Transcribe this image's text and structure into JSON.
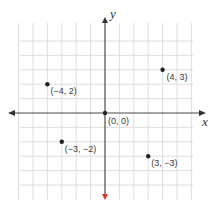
{
  "diagram": {
    "type": "coordinate-plane",
    "axes": {
      "x_label": "x",
      "y_label": "y"
    },
    "grid": {
      "x_range": [
        -6,
        6
      ],
      "y_range": [
        -5,
        5
      ],
      "spacing_px": 14.4,
      "origin_px": [
        105,
        113
      ],
      "line_color": "#d6d6d6",
      "axis_color": "#4a4a4a",
      "accent_arrow_color": "#d9342b"
    },
    "points": [
      {
        "x": 0,
        "y": 0,
        "label": "(0, 0)",
        "label_dx": 3,
        "label_dy": 11
      },
      {
        "x": 4,
        "y": 3,
        "label": "(4, 3)",
        "label_dx": 4,
        "label_dy": 10
      },
      {
        "x": -4,
        "y": 2,
        "label": "(−4, 2)",
        "label_dx": 3,
        "label_dy": 10
      },
      {
        "x": -3,
        "y": -2,
        "label": "(−3, −2)",
        "label_dx": 3,
        "label_dy": 10
      },
      {
        "x": 3,
        "y": -3,
        "label": "(3, −3)",
        "label_dx": 3,
        "label_dy": 10
      }
    ]
  }
}
